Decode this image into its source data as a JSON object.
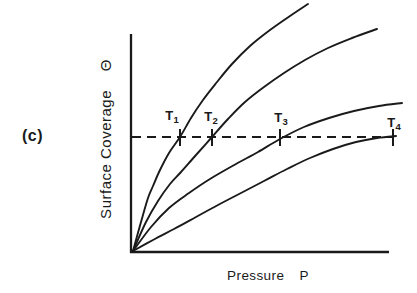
{
  "figure_label": "(c)",
  "colors": {
    "ink": "#1a1a1a",
    "background": "#ffffff"
  },
  "chart_data": {
    "type": "line",
    "title": "",
    "xlabel": "Pressure P",
    "ylabel": "Surface Coverage Θ",
    "x_axis": {
      "label": "Pressure",
      "symbol": "P"
    },
    "y_axis": {
      "label": "Surface Coverage",
      "symbol": "Θ"
    },
    "axes_note": "qualitative sketch, no numeric ticks; four isotherms rise from origin, steepness decreases from T1 to T4; horizontal dashed line marks constant coverage crossed at increasing pressure",
    "layout": {
      "y_axis_line": {
        "x": 131,
        "y1": 34,
        "y2": 253
      },
      "x_axis_line": {
        "y": 252,
        "x1": 130,
        "x2": 389
      },
      "axis_stroke_width": 2.3,
      "curve_stroke_width": 1.9
    },
    "guide_line": {
      "style": "dashed",
      "y": 137,
      "x1": 132,
      "x2": 393,
      "dash": "9 6",
      "stroke_width": 2.1,
      "tick_x": [
        180,
        212,
        280,
        393
      ],
      "tick_y1": 129,
      "tick_y2": 146,
      "tick_stroke_width": 2
    },
    "temperature_labels": [
      {
        "base": "T",
        "sub": "1",
        "x": 172,
        "y": 109
      },
      {
        "base": "T",
        "sub": "2",
        "x": 211,
        "y": 110
      },
      {
        "base": "T",
        "sub": "3",
        "x": 281,
        "y": 111
      },
      {
        "base": "T",
        "sub": "4",
        "x": 394,
        "y": 116
      }
    ],
    "series": [
      {
        "name": "T1 isotherm (steepest)",
        "points": [
          [
            133,
            251
          ],
          [
            141,
            222
          ],
          [
            148,
            198
          ],
          [
            153,
            186
          ],
          [
            160,
            170
          ],
          [
            169,
            153
          ],
          [
            180,
            137
          ],
          [
            191,
            118
          ],
          [
            203,
            100
          ],
          [
            217,
            82
          ],
          [
            232,
            64
          ],
          [
            250,
            46
          ],
          [
            270,
            30
          ],
          [
            290,
            16
          ],
          [
            308,
            4
          ]
        ]
      },
      {
        "name": "T2 isotherm",
        "points": [
          [
            133,
            251
          ],
          [
            146,
            222
          ],
          [
            158,
            201
          ],
          [
            170,
            184
          ],
          [
            181,
            172
          ],
          [
            196,
            155
          ],
          [
            212,
            137
          ],
          [
            228,
            119
          ],
          [
            245,
            102
          ],
          [
            264,
            87
          ],
          [
            284,
            73
          ],
          [
            305,
            60
          ],
          [
            328,
            48
          ],
          [
            352,
            38
          ],
          [
            377,
            29
          ]
        ]
      },
      {
        "name": "T3 isotherm",
        "points": [
          [
            133,
            251
          ],
          [
            151,
            227
          ],
          [
            169,
            208
          ],
          [
            189,
            193
          ],
          [
            210,
            179
          ],
          [
            236,
            164
          ],
          [
            258,
            152
          ],
          [
            280,
            139
          ],
          [
            304,
            127
          ],
          [
            329,
            118
          ],
          [
            354,
            111
          ],
          [
            379,
            106
          ],
          [
            402,
            103
          ]
        ]
      },
      {
        "name": "T4 isotherm (shallowest)",
        "points": [
          [
            133,
            251
          ],
          [
            153,
            240
          ],
          [
            174,
            229
          ],
          [
            196,
            217
          ],
          [
            218,
            205
          ],
          [
            241,
            193
          ],
          [
            264,
            181
          ],
          [
            287,
            169
          ],
          [
            310,
            158
          ],
          [
            333,
            149
          ],
          [
            356,
            142
          ],
          [
            377,
            138
          ],
          [
            396,
            136
          ]
        ]
      }
    ]
  }
}
